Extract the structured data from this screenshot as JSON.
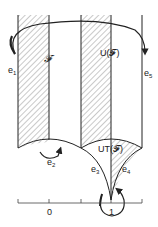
{
  "diagram": {
    "type": "fundamental-domain-figure",
    "regions": [
      {
        "id": "F",
        "label": "𝓕",
        "hatched": true
      },
      {
        "id": "UF",
        "label": "U(𝓕)",
        "hatched": true
      },
      {
        "id": "UTF",
        "label": "UT(𝓕)",
        "hatched": true
      }
    ],
    "edges": [
      {
        "id": "e1",
        "label": "e",
        "sub": "1"
      },
      {
        "id": "e2",
        "label": "e",
        "sub": "2"
      },
      {
        "id": "e3",
        "label": "e",
        "sub": "3"
      },
      {
        "id": "e4",
        "label": "e",
        "sub": "4"
      },
      {
        "id": "e5",
        "label": "e",
        "sub": "5"
      }
    ],
    "axis": {
      "ticks": [
        "0",
        "1"
      ]
    },
    "colors": {
      "line": "#222222",
      "hatch": "#666666"
    }
  },
  "labels": {
    "F": "𝓕",
    "UF": "U(𝓕)",
    "UTF": "UT(𝓕)",
    "tick0": "0",
    "tick1": "1"
  }
}
